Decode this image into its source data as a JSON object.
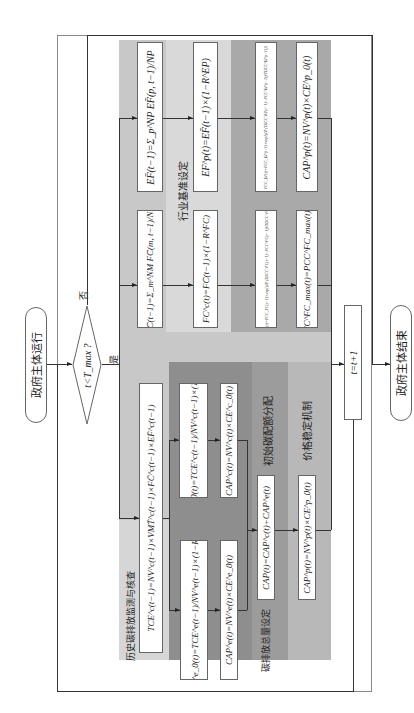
{
  "colors": {
    "outer_frame": "#8a8a8a",
    "region_base": "#c8c8c8",
    "region_industry": "#d9d9d9",
    "region_price": "#a9a9a9",
    "region_initial_alloc": "#8c8c8c",
    "region_total": "#a5a5a5",
    "region_history": "#d0d0d0",
    "box_fill": "#ffffff"
  },
  "start": {
    "label": "政府主体运行"
  },
  "decision": {
    "label": "t<T_max ?",
    "yes": "是",
    "no": "否"
  },
  "increment": {
    "label": "t=t+1"
  },
  "end": {
    "label": "政府主体结束"
  },
  "sections": {
    "history": "历史碳排放监测与核查",
    "industry": "行业基准设定",
    "initial_alloc": "初始碳配额分配",
    "total": "碳排放总量设定",
    "price": "价格稳定机制"
  },
  "formulas": {
    "ef_bar": "EF̄(t−1)=Σ_p^NP EF̄(p, t−1)/NP",
    "ef_p": "EF^p(t)=EF̄(t−1)×(1−R^EP)",
    "pcc_ep": "PCC_EP(t)=PCC_EP(t−1)×exp[(IZ·(TDCC^EP(t−1)−PCC^EP(t−1))/TDCC^EP(t−1))]",
    "cap_ep": "CAP^p(t)=NV^p(t)×CE^p_0(t)",
    "fc_bar": "FC̄(t−1)=Σ_m^NM FC̄(m, t−1)/NM",
    "fc_c": "FC^c(t)=FC̄(t−1)×(1−R^FC)",
    "pcc_fc": "PCC_FC(t)=PCC_FC(t−1)×exp[(IZ·(TDCC^FC(t−1)−PCC^FC(t−1))/TDCC^FC(t−1))]",
    "pcc_max": "PCC^FC_max(t)=PCC^FC_max(t)×2",
    "tce_c": "TCE^c(t−1)=NV^c(t−1)×VMT̄^c(t−1)×FC̄^c(t−1)×EF̄^c(t−1)",
    "ce_c": "CE^c_0(t)=TCE^c(t−1)/NV^c(t−1)×(1−R^c)",
    "cap_c": "CAP^c(t)=NV^c(t)×CE^c_0(t)",
    "ce_e": "CE^e_0(t)=TCE^e(t−1)/NV^e(t−1)×(1−R^e)",
    "cap_e": "CAP^e(t)=NV^e(t)×CE^e_0(t)",
    "cap_total": "CAP(t)=CAP^c(t)+CAP^e(t)",
    "cap_p": "CAP^p(t)=NV^p(t)×CE^p_0(t)"
  }
}
